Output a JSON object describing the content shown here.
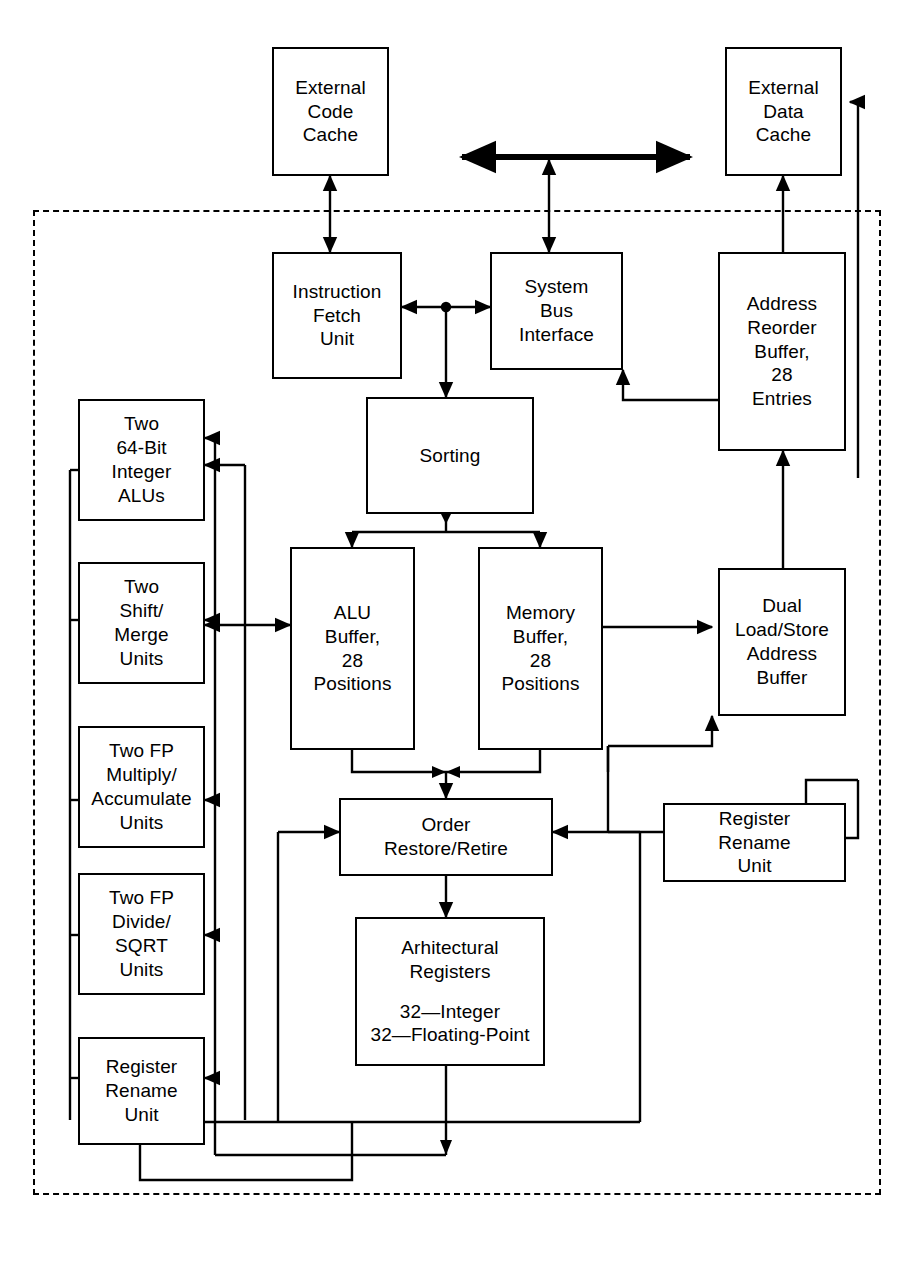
{
  "diagram": {
    "chip_boundary_label": "processor chip boundary (dashed)",
    "line_color": "#000000",
    "background": "#ffffff"
  },
  "blocks": {
    "external_code_cache": {
      "lines": [
        "External",
        "Code",
        "Cache"
      ]
    },
    "external_data_cache": {
      "lines": [
        "External",
        "Data",
        "Cache"
      ]
    },
    "instruction_fetch_unit": {
      "lines": [
        "Instruction",
        "Fetch",
        "Unit"
      ]
    },
    "system_bus_interface": {
      "lines": [
        "System",
        "Bus",
        "Interface"
      ]
    },
    "address_reorder_buffer": {
      "lines": [
        "Address",
        "Reorder",
        "Buffer,",
        "28",
        "Entries"
      ]
    },
    "sorting": {
      "lines": [
        "Sorting"
      ]
    },
    "alu_buffer": {
      "lines": [
        "ALU",
        "Buffer,",
        "28",
        "Positions"
      ]
    },
    "memory_buffer": {
      "lines": [
        "Memory",
        "Buffer,",
        "28",
        "Positions"
      ]
    },
    "dual_load_store_address_buffer": {
      "lines": [
        "Dual",
        "Load/Store",
        "Address",
        "Buffer"
      ]
    },
    "integer_alus": {
      "lines": [
        "Two",
        "64-Bit",
        "Integer",
        "ALUs"
      ]
    },
    "shift_merge_units": {
      "lines": [
        "Two",
        "Shift/",
        "Merge",
        "Units"
      ]
    },
    "fp_multiply_accumulate_units": {
      "lines": [
        "Two FP",
        "Multiply/",
        "Accumulate",
        "Units"
      ]
    },
    "fp_divide_sqrt_units": {
      "lines": [
        "Two FP",
        "Divide/",
        "SQRT",
        "Units"
      ]
    },
    "register_rename_unit_left": {
      "lines": [
        "Register",
        "Rename",
        "Unit"
      ]
    },
    "register_rename_unit_right": {
      "lines": [
        "Register",
        "Rename",
        "Unit"
      ]
    },
    "order_restore_retire": {
      "lines": [
        "Order",
        "Restore/Retire"
      ]
    },
    "architectural_registers": {
      "lines_top": [
        "Arhitectural",
        "Registers"
      ],
      "lines_bottom": [
        "32—Integer",
        "32—Floating-Point"
      ]
    }
  }
}
